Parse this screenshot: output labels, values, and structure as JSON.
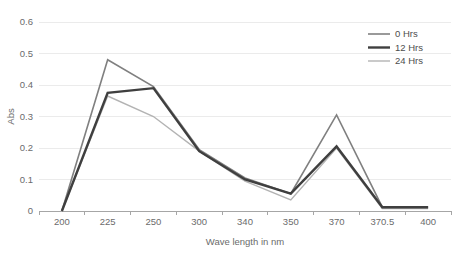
{
  "chart_data": {
    "type": "line",
    "title": "",
    "subtitle": "",
    "xlabel": "Wave length in nm",
    "ylabel": "Abs",
    "categories": [
      "200",
      "225",
      "250",
      "300",
      "340",
      "350",
      "370",
      "370.5",
      "400"
    ],
    "x_tick_labels": [
      "200",
      "225",
      "250",
      "300",
      "340",
      "350",
      "370",
      "370.5",
      "400"
    ],
    "y_tick_labels": [
      "0",
      "0.1",
      "0.2",
      "0.3",
      "0.4",
      "0.5",
      "0.6"
    ],
    "y_ticks": [
      0,
      0.1,
      0.2,
      0.3,
      0.4,
      0.5,
      0.6
    ],
    "ylim": [
      0,
      0.6
    ],
    "grid": "horizontal",
    "legend_position": "top-right",
    "series": [
      {
        "name": "0 Hrs",
        "color": "#808080",
        "width": 1.6,
        "values": [
          0,
          0.48,
          0.395,
          0.195,
          0.105,
          0.055,
          0.305,
          0.012,
          0.012
        ]
      },
      {
        "name": "12 Hrs",
        "color": "#3f3f3f",
        "width": 2.4,
        "values": [
          0,
          0.375,
          0.39,
          0.19,
          0.1,
          0.055,
          0.205,
          0.012,
          0.012
        ]
      },
      {
        "name": "24 Hrs",
        "color": "#b3b3b3",
        "width": 1.4,
        "values": [
          0,
          0.365,
          0.3,
          0.19,
          0.095,
          0.035,
          0.2,
          0.008,
          0.008
        ]
      }
    ]
  },
  "legend": {
    "entries": [
      {
        "label": "0 Hrs"
      },
      {
        "label": "12 Hrs"
      },
      {
        "label": "24 Hrs"
      }
    ]
  },
  "axes": {
    "x_title": "Wave length in nm",
    "y_title": "Abs"
  }
}
